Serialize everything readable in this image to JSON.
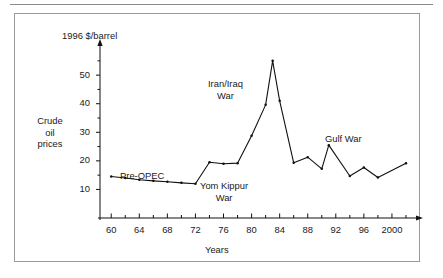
{
  "figure": {
    "side_label_lines": [
      "Crude",
      "oil",
      "prices"
    ],
    "y_axis_title": "1996 $/barrel",
    "x_axis_title": "Years"
  },
  "annotations": {
    "pre_opec": "Pre-OPEC",
    "yom_kippur_line1": "Yom Kippur",
    "yom_kippur_line2": "War",
    "iran_iraq_line1": "Iran/Iraq",
    "iran_iraq_line2": "War",
    "gulf_war": "Gulf War"
  },
  "axis": {
    "y_tick_labels": [
      "10",
      "20",
      "30",
      "40",
      "50"
    ],
    "x_tick_labels": [
      "60",
      "64",
      "68",
      "72",
      "76",
      "80",
      "84",
      "88",
      "92",
      "96",
      "2000"
    ]
  },
  "colors": {
    "line": "#111111",
    "axis": "#111111",
    "frame": "#9a9a9a",
    "rule": "#8a8a8a",
    "text": "#1a1a1a"
  },
  "chart_data": {
    "type": "line",
    "title": "",
    "subtitle": "",
    "xlabel": "Years",
    "ylabel": "1996 $/barrel",
    "ylim": [
      0,
      58
    ],
    "xlim": [
      1958,
      2002
    ],
    "grid": false,
    "legend": null,
    "y_ticks_major": [
      10,
      20,
      30,
      40,
      50
    ],
    "y_ticks_minor": [
      15,
      25,
      35,
      45,
      55
    ],
    "x_ticks_major": [
      1960,
      1964,
      1968,
      1972,
      1976,
      1980,
      1984,
      1988,
      1992,
      1996,
      2000
    ],
    "x_ticks_minor": [
      1962,
      1966,
      1970,
      1974,
      1978,
      1982,
      1986,
      1990,
      1994,
      1998,
      2002
    ],
    "series": [
      {
        "name": "Crude oil prices",
        "x": [
          1960,
          1962,
          1964,
          1966,
          1968,
          1970,
          1972,
          1974,
          1976,
          1978,
          1980,
          1982,
          1983,
          1984,
          1986,
          1988,
          1990,
          1991,
          1994,
          1996,
          1998,
          2002
        ],
        "values": [
          14.5,
          14.0,
          13.4,
          13.0,
          12.7,
          12.3,
          12.0,
          19.5,
          19.0,
          19.2,
          28.8,
          39.6,
          55.0,
          41.0,
          19.3,
          21.3,
          17.2,
          25.5,
          14.7,
          17.7,
          14.2,
          19.2
        ],
        "markers": true
      }
    ],
    "annotations": [
      {
        "text": "Pre-OPEC",
        "x": 1967,
        "y": 16.5
      },
      {
        "text": "Yom Kippur War",
        "x": 1977,
        "y": 15.5
      },
      {
        "text": "Iran/Iraq War",
        "x": 1979,
        "y": 46
      },
      {
        "text": "Gulf War",
        "x": 1994,
        "y": 31
      }
    ]
  }
}
